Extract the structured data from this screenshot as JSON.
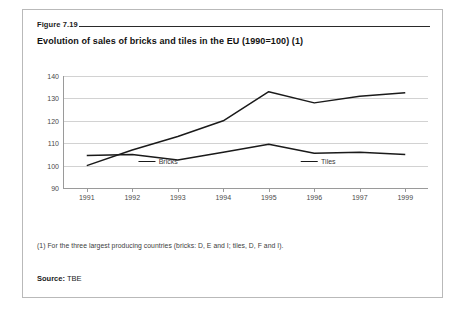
{
  "figure": {
    "label": "Figure 7.19",
    "title": "Evolution of sales of bricks and tiles in the EU (1990=100) (1)",
    "footnote": "(1) For the three largest producing countries (bricks: D, E and I; tiles, D, F and I).",
    "source_label": "Source:",
    "source_value": "TBE"
  },
  "chart_data": {
    "type": "line",
    "title": "Evolution of sales of bricks and tiles in the EU (1990=100) (1)",
    "xlabel": "",
    "ylabel": "",
    "categories": [
      "1991",
      "1992",
      "1993",
      "1994",
      "1995",
      "1996",
      "1997",
      "1999"
    ],
    "yticks": [
      90,
      100,
      110,
      120,
      130,
      140
    ],
    "ylim": [
      90,
      140
    ],
    "grid": true,
    "legend_position": "bottom",
    "line_color": "#1a1a1a",
    "series": [
      {
        "name": "Bricks",
        "values": [
          100,
          107,
          113,
          120,
          133,
          128,
          131,
          132.5
        ]
      },
      {
        "name": "Tiles",
        "values": [
          104.5,
          105,
          102.5,
          106,
          109.5,
          105.5,
          106,
          105
        ]
      }
    ]
  }
}
